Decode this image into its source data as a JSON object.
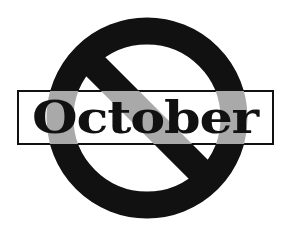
{
  "image": {
    "description": "Prohibition sign over the word October",
    "width": 288,
    "height": 235
  },
  "sign": {
    "type": "no-symbol",
    "ring_color": "#111111",
    "slash_color": "#111111",
    "inside_banner_color": "#a9a9a9",
    "background": "#ffffff"
  },
  "banner": {
    "word": "October",
    "text_color": "#111111",
    "border_color": "#111111",
    "fill": "#ffffff"
  }
}
